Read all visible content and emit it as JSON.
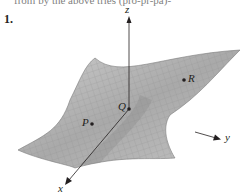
{
  "header": {
    "cut_off_text": "from by the above tries (pro-pr-pa)-",
    "exercise_number": "1."
  },
  "figure": {
    "type": "3d-surface",
    "surface_color": "#b3b3b3",
    "grid_color": "#8c8c8c",
    "axes": {
      "x": "x",
      "y": "y",
      "z": "z"
    },
    "points": [
      {
        "label": "P",
        "x": 92,
        "y": 124
      },
      {
        "label": "Q",
        "x": 129,
        "y": 109
      },
      {
        "label": "R",
        "x": 184,
        "y": 80
      }
    ]
  }
}
